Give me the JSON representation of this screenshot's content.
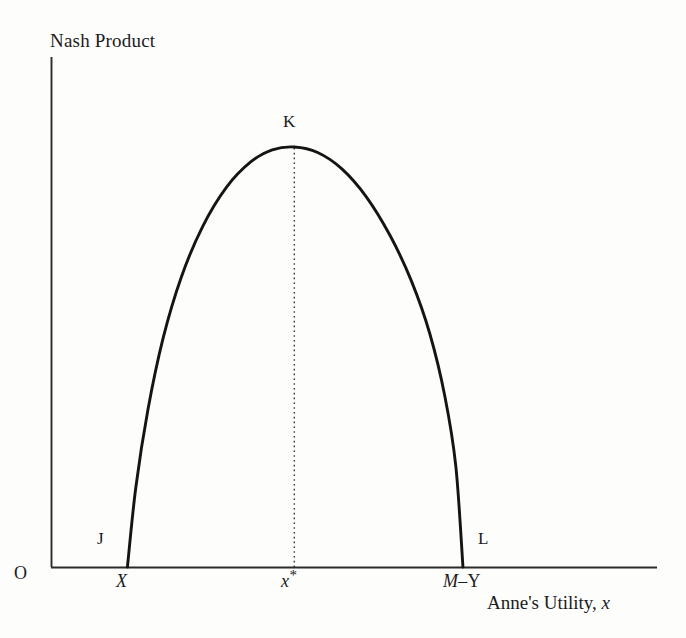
{
  "figure": {
    "background_color": "#fdfdfc",
    "ink_color": "#1b1b1b",
    "axis_color": "#2b2b2b",
    "curve_color": "#141414"
  },
  "axes": {
    "y_axis_title": "Nash Product",
    "x_axis_title_prefix": "Anne's Utility, ",
    "x_axis_title_variable": "x",
    "origin_label": "O"
  },
  "points": {
    "left_foot_label": "J",
    "peak_label": "K",
    "right_foot_label": "L"
  },
  "ticks": {
    "left_foot": "X",
    "peak": "x",
    "peak_superscript": "*",
    "right_foot_m": "M",
    "right_foot_dash": "–",
    "right_foot_y": "Y"
  },
  "chart_data": {
    "type": "line",
    "title": "",
    "subtitle": "",
    "xlabel": "Anne's Utility, x",
    "ylabel": "Nash Product",
    "grid": false,
    "legend": null,
    "axis_style": "open L-shaped axes, no tick marks, no numeric scale",
    "xlim": [
      0,
      1
    ],
    "ylim": [
      0,
      1
    ],
    "x_tick_labels": [
      "X",
      "x*",
      "M–Y"
    ],
    "x_tick_values": [
      0.1261,
      0.4015,
      0.6798
    ],
    "y_tick_labels": [],
    "annotations": [
      {
        "label": "J",
        "x": 0.1261,
        "y": 0.0,
        "note": "left zero of the Nash product, x = X"
      },
      {
        "label": "K",
        "x": 0.4015,
        "y": 1.0,
        "note": "maximum of the Nash product at x = x*"
      },
      {
        "label": "L",
        "x": 0.6798,
        "y": 0.0,
        "note": "right zero of the Nash product, x = M–Y"
      },
      {
        "label": "O",
        "x": 0.0,
        "y": 0.0,
        "note": "origin"
      }
    ],
    "dropline": {
      "from_label": "K",
      "x": 0.4015,
      "y_top": 1.0,
      "y_bottom": 0.0,
      "style": "dotted"
    },
    "series": [
      {
        "name": "Nash product",
        "shape": "concave hump (inverted-U), zero at both endpoints",
        "x": [
          0.1261,
          0.14,
          0.16,
          0.185,
          0.215,
          0.25,
          0.29,
          0.33,
          0.365,
          0.4015,
          0.44,
          0.48,
          0.52,
          0.56,
          0.595,
          0.625,
          0.65,
          0.668,
          0.6798
        ],
        "y": [
          0.0,
          0.19,
          0.375,
          0.545,
          0.69,
          0.81,
          0.905,
          0.965,
          0.993,
          1.0,
          0.987,
          0.948,
          0.882,
          0.788,
          0.68,
          0.556,
          0.406,
          0.24,
          0.0
        ]
      }
    ]
  }
}
